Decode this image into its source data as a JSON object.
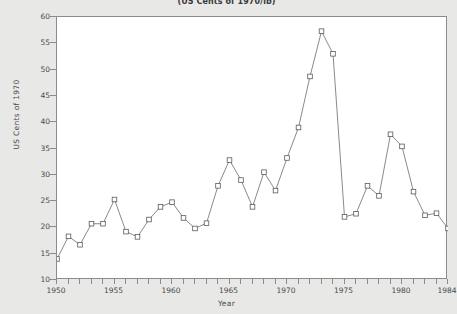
{
  "chart_data": {
    "type": "line",
    "title": "(US Cents of 1970/lb)",
    "xlabel": "Year",
    "ylabel": "US Cents of 1970",
    "xlim": [
      1950,
      1984
    ],
    "ylim": [
      10,
      60
    ],
    "yticks": [
      10,
      15,
      20,
      25,
      30,
      35,
      40,
      45,
      50,
      55,
      60
    ],
    "xticks": [
      1950,
      1955,
      1960,
      1965,
      1970,
      1975,
      1980,
      1984
    ],
    "xtick_labels": [
      "1950",
      "1955",
      "1960",
      "1965",
      "1970",
      "1975",
      "1980",
      "1984"
    ],
    "xtick_minor_step": 1,
    "grid": false,
    "legend": null,
    "marker": "open-square",
    "line_color": "#6b6b6b",
    "marker_color": "#5a5a5a",
    "x": [
      1950,
      1951,
      1952,
      1953,
      1954,
      1955,
      1956,
      1957,
      1958,
      1959,
      1960,
      1961,
      1962,
      1963,
      1964,
      1965,
      1966,
      1967,
      1968,
      1969,
      1970,
      1971,
      1972,
      1973,
      1974,
      1975,
      1976,
      1977,
      1978,
      1979,
      1980,
      1981,
      1982,
      1983,
      1984
    ],
    "values": [
      14.0,
      18.3,
      16.7,
      20.7,
      20.7,
      25.3,
      19.2,
      18.2,
      21.5,
      23.9,
      24.8,
      21.8,
      19.8,
      20.8,
      27.9,
      32.8,
      29.0,
      23.9,
      30.5,
      27.0,
      33.2,
      39.0,
      48.7,
      57.3,
      53.0,
      22.0,
      22.6,
      27.9,
      26.0,
      37.7,
      35.4,
      26.8,
      22.3,
      22.7,
      19.8
    ]
  }
}
